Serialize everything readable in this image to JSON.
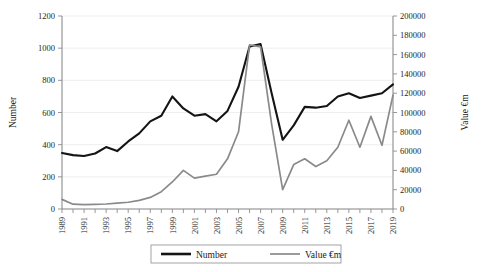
{
  "chart_data": {
    "type": "line",
    "title": "",
    "xlabel": "",
    "ylabel": "Number",
    "y2label": "Value €m",
    "grid": true,
    "legend_position": "bottom",
    "ylim": [
      0,
      1200
    ],
    "y2lim": [
      0,
      200000
    ],
    "ytick_step": 200,
    "y2tick_step": 20000,
    "yticks": [
      "0",
      "200",
      "400",
      "600",
      "800",
      "1000",
      "1200"
    ],
    "y2ticks": [
      "0",
      "20000",
      "40000",
      "60000",
      "80000",
      "100000",
      "120000",
      "140000",
      "160000",
      "180000",
      "200000"
    ],
    "x": [
      1989,
      1990,
      1991,
      1992,
      1993,
      1994,
      1995,
      1996,
      1997,
      1998,
      1999,
      2000,
      2001,
      2002,
      2003,
      2004,
      2005,
      2006,
      2007,
      2008,
      2009,
      2010,
      2011,
      2012,
      2013,
      2014,
      2015,
      2016,
      2017,
      2018,
      2019
    ],
    "xtick_labels": [
      "1989",
      "",
      "1991",
      "",
      "1993",
      "",
      "1995",
      "",
      "1997",
      "",
      "1999",
      "",
      "2001",
      "",
      "2003",
      "",
      "2005",
      "",
      "2007",
      "",
      "2009",
      "",
      "2011",
      "",
      "2013",
      "",
      "2015",
      "",
      "2017",
      "",
      "2019"
    ],
    "series": [
      {
        "name": "Number",
        "axis": "left",
        "color": "#141414",
        "values": [
          348,
          335,
          330,
          345,
          385,
          360,
          420,
          470,
          545,
          580,
          700,
          625,
          580,
          590,
          545,
          610,
          760,
          1010,
          1025,
          720,
          430,
          520,
          635,
          630,
          640,
          700,
          720,
          690,
          705,
          720,
          775
        ]
      },
      {
        "name": "Value €m",
        "axis": "right",
        "color": "#8a8a8a",
        "values": [
          10000,
          5000,
          4500,
          4800,
          5200,
          6000,
          7000,
          9000,
          12000,
          18000,
          28000,
          40000,
          32000,
          34000,
          36000,
          52000,
          80000,
          170000,
          168000,
          88000,
          20000,
          46000,
          52000,
          44000,
          50000,
          64000,
          92000,
          64000,
          96000,
          66000,
          118000
        ]
      }
    ],
    "legend": [
      {
        "label": "Number",
        "color": "#141414",
        "width": 2.6
      },
      {
        "label": "Value €m",
        "color": "#8a8a8a",
        "width": 1.7
      }
    ]
  }
}
